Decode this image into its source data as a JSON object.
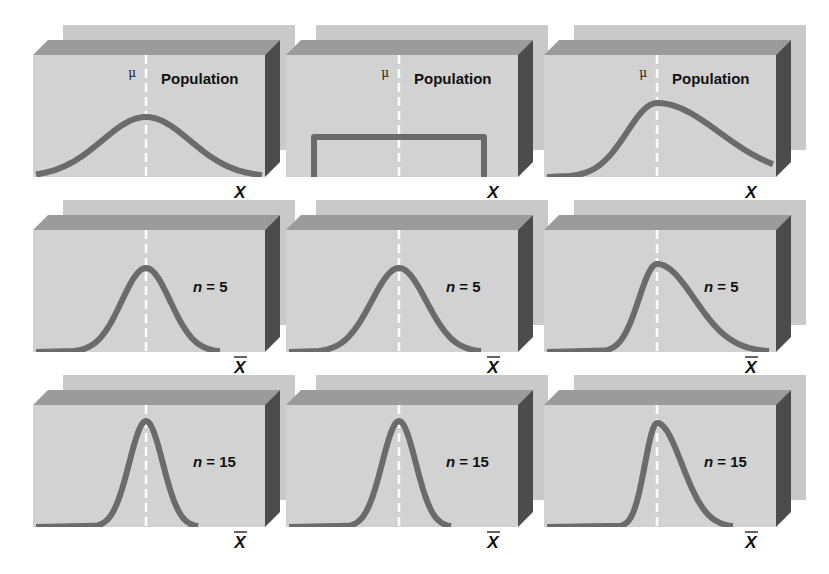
{
  "colors": {
    "background": "#ffffff",
    "back_panel": "#c9c9c9",
    "front_face": "#d2d2d2",
    "top_face": "#9b9b9b",
    "side_face": "#4c4c4c",
    "curve": "#6b6b6b",
    "mean_line": "#ffffff"
  },
  "labels": {
    "population": "Population",
    "mu": "μ",
    "x": "X",
    "xbar": "X"
  },
  "columns": [
    {
      "name": "normal",
      "population_shape": "bell"
    },
    {
      "name": "uniform",
      "population_shape": "uniform"
    },
    {
      "name": "right-skewed",
      "population_shape": "right-skewed"
    }
  ],
  "rows": [
    {
      "name": "population",
      "label": "Population",
      "axis": "X",
      "has_bar": false
    },
    {
      "name": "n5",
      "label_prefix": "n",
      "label_suffix": " = 5",
      "n": 5,
      "axis": "X",
      "has_bar": true
    },
    {
      "name": "n15",
      "label_prefix": "n",
      "label_suffix": " = 15",
      "n": 15,
      "axis": "X",
      "has_bar": true
    }
  ],
  "panels": [
    {
      "row": 0,
      "col": 0,
      "x": 33,
      "y": 40,
      "curve": "bell",
      "spread": 1.0,
      "label": "Population",
      "show_mu": true
    },
    {
      "row": 0,
      "col": 1,
      "x": 286,
      "y": 40,
      "curve": "uniform",
      "spread": 1.0,
      "label": "Population",
      "show_mu": true
    },
    {
      "row": 0,
      "col": 2,
      "x": 544,
      "y": 40,
      "curve": "skew",
      "spread": 1.0,
      "label": "Population",
      "show_mu": true
    },
    {
      "row": 1,
      "col": 0,
      "x": 33,
      "y": 215,
      "curve": "bell",
      "spread": 0.55,
      "label": "n = 5",
      "show_mu": false
    },
    {
      "row": 1,
      "col": 1,
      "x": 286,
      "y": 215,
      "curve": "bell",
      "spread": 0.62,
      "label": "n = 5",
      "show_mu": false
    },
    {
      "row": 1,
      "col": 2,
      "x": 544,
      "y": 215,
      "curve": "skew",
      "spread": 0.6,
      "label": "n = 5",
      "show_mu": false
    },
    {
      "row": 2,
      "col": 0,
      "x": 33,
      "y": 390,
      "curve": "bell",
      "spread": 0.38,
      "label": "n = 15",
      "show_mu": false
    },
    {
      "row": 2,
      "col": 1,
      "x": 286,
      "y": 390,
      "curve": "bell",
      "spread": 0.38,
      "label": "n = 15",
      "show_mu": false
    },
    {
      "row": 2,
      "col": 2,
      "x": 544,
      "y": 390,
      "curve": "skew",
      "spread": 0.4,
      "label": "n = 15",
      "show_mu": false
    }
  ]
}
